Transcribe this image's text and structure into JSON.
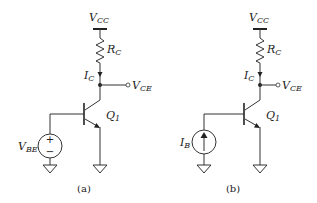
{
  "figure": {
    "circuits": [
      {
        "id": "a",
        "caption": "(a)",
        "supply": {
          "main": "V",
          "sub": "CC"
        },
        "resistor": {
          "main": "R",
          "sub": "C"
        },
        "current": {
          "main": "I",
          "sub": "C"
        },
        "output": {
          "main": "V",
          "sub": "CE"
        },
        "transistor": {
          "main": "Q",
          "sub": "1"
        },
        "source": {
          "type": "voltage",
          "main": "V",
          "sub": "BE",
          "plus": "+",
          "minus": "−"
        }
      },
      {
        "id": "b",
        "caption": "(b)",
        "supply": {
          "main": "V",
          "sub": "CC"
        },
        "resistor": {
          "main": "R",
          "sub": "C"
        },
        "current": {
          "main": "I",
          "sub": "C"
        },
        "output": {
          "main": "V",
          "sub": "CE"
        },
        "transistor": {
          "main": "Q",
          "sub": "1"
        },
        "source": {
          "type": "current",
          "main": "I",
          "sub": "B"
        }
      }
    ],
    "colors": {
      "line": "#333333",
      "text": "#222222",
      "background": "#ffffff"
    }
  }
}
